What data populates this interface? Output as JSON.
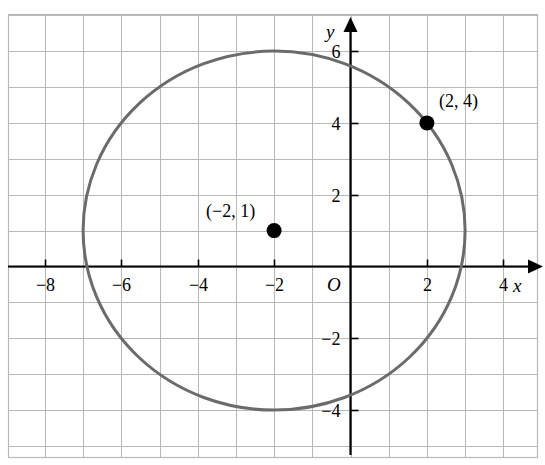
{
  "chart_data": {
    "type": "scatter",
    "title": "",
    "xlabel": "x",
    "ylabel": "y",
    "origin_label": "O",
    "grid": true,
    "xlim": [
      -9.2,
      5.2
    ],
    "ylim": [
      -5.1,
      7.1
    ],
    "x_ticks": [
      -8,
      -6,
      -4,
      -2,
      2,
      4
    ],
    "y_ticks": [
      -4,
      -2,
      2,
      4,
      6
    ],
    "x_tick_labels": [
      "−8",
      "−6",
      "−4",
      "−2",
      "2",
      "4"
    ],
    "y_tick_labels": [
      "−4",
      "−2",
      "2",
      "4",
      "6"
    ],
    "grid_step": 1,
    "shapes": [
      {
        "kind": "circle",
        "center_x": -2,
        "center_y": 1,
        "radius": 5,
        "color": "#6b6b6b",
        "stroke_width": 3
      }
    ],
    "points": [
      {
        "name": "center-point",
        "x": -2,
        "y": 1,
        "label": "(−2, 1)",
        "color": "#000000",
        "label_dx": -68,
        "label_dy": -14
      },
      {
        "name": "on-circle-point",
        "x": 2,
        "y": 4,
        "label": "(2, 4)",
        "color": "#000000",
        "label_dx": 12,
        "label_dy": -16
      }
    ],
    "colors": {
      "grid_line": "#b8b8b8",
      "axis_line": "#000000",
      "curve": "#6b6b6b",
      "point": "#000000",
      "background": "#ffffff"
    }
  }
}
